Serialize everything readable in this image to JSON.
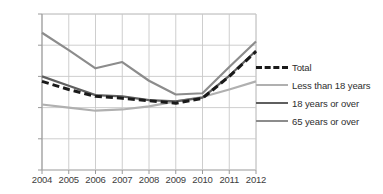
{
  "chart_data": {
    "type": "line",
    "title": "",
    "xlabel": "",
    "ylabel": "",
    "categories": [
      "2004",
      "2005",
      "2006",
      "2007",
      "2008",
      "2009",
      "2010",
      "2011",
      "2012"
    ],
    "x": [
      2004,
      2005,
      2006,
      2007,
      2008,
      2009,
      2010,
      2011,
      2012
    ],
    "ylim": [
      0.0,
      25.0
    ],
    "yticks": [
      "0.0",
      "5.0",
      "10.0",
      "15.0",
      "20.0",
      "25.0"
    ],
    "ytick_values": [
      0.0,
      5.0,
      10.0,
      15.0,
      20.0,
      25.0
    ],
    "grid": true,
    "legend_position": "right",
    "series": [
      {
        "name": "Total",
        "color": "#1a1a1a",
        "style": "dashed",
        "width": 3.0,
        "values": [
          14.2,
          12.9,
          11.8,
          11.5,
          11.1,
          10.7,
          11.5,
          15.0,
          19.0
        ]
      },
      {
        "name": "Less than 18 years",
        "color": "#b0b0b0",
        "style": "solid",
        "width": 2.2,
        "values": [
          10.5,
          10.0,
          9.5,
          9.7,
          10.2,
          11.0,
          11.7,
          12.9,
          14.2
        ]
      },
      {
        "name": "18 years or over",
        "color": "#5f5f5f",
        "style": "solid",
        "width": 2.2,
        "values": [
          15.0,
          13.5,
          12.0,
          11.8,
          11.2,
          11.0,
          11.6,
          15.1,
          19.1
        ]
      },
      {
        "name": "65 years or over",
        "color": "#8c8c8c",
        "style": "solid",
        "width": 2.2,
        "values": [
          22.0,
          19.2,
          16.3,
          17.3,
          14.3,
          12.1,
          12.3,
          16.5,
          20.6
        ]
      }
    ]
  },
  "legend": {
    "items": [
      {
        "label": "Total"
      },
      {
        "label": "Less than 18 years"
      },
      {
        "label": "18 years or over"
      },
      {
        "label": "65 years or over"
      }
    ]
  },
  "axes": {
    "y": {
      "labels": [
        "25.0",
        "20.0",
        "15.0",
        "10.0",
        "5.0",
        "0.0"
      ]
    },
    "x": {
      "labels": [
        "2004",
        "2005",
        "2006",
        "2007",
        "2008",
        "2009",
        "2010",
        "2011",
        "2012"
      ]
    }
  }
}
